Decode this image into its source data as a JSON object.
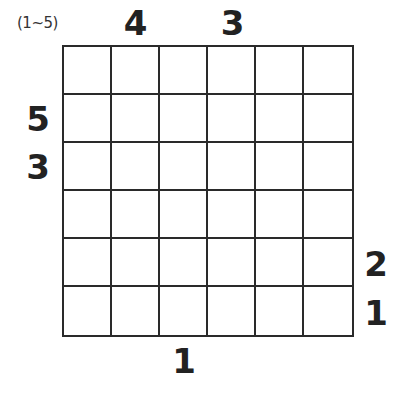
{
  "puzzle": {
    "range_label": "(1~5)",
    "size": 6,
    "clues": {
      "top": [
        "",
        "4",
        "",
        "3",
        "",
        ""
      ],
      "bottom": [
        "",
        "",
        "1",
        "",
        "",
        ""
      ],
      "left": [
        "",
        "5",
        "3",
        "",
        "",
        ""
      ],
      "right": [
        "",
        "",
        "",
        "",
        "2",
        "1"
      ]
    },
    "cells": [
      [
        "",
        "",
        "",
        "",
        "",
        ""
      ],
      [
        "",
        "",
        "",
        "",
        "",
        ""
      ],
      [
        "",
        "",
        "",
        "",
        "",
        ""
      ],
      [
        "",
        "",
        "",
        "",
        "",
        ""
      ],
      [
        "",
        "",
        "",
        "",
        "",
        ""
      ],
      [
        "",
        "",
        "",
        "",
        "",
        ""
      ]
    ]
  }
}
